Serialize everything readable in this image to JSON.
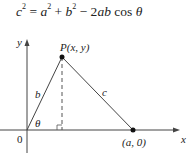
{
  "formula": {
    "c": "c",
    "c_exp": "2",
    "eq": " = ",
    "a": "a",
    "a_exp": "2",
    "plus": " + ",
    "b": "b",
    "b_exp": "2",
    "minus": " − 2",
    "ab": "ab",
    "cos": " cos ",
    "theta": "θ"
  },
  "diagram": {
    "y_axis_label": "y",
    "x_axis_label": "x",
    "origin_label": "0",
    "point_p_label": "P(x, y)",
    "point_a_label": "(a, 0)",
    "side_b_label": "b",
    "side_c_label": "c",
    "angle_label": "θ"
  }
}
